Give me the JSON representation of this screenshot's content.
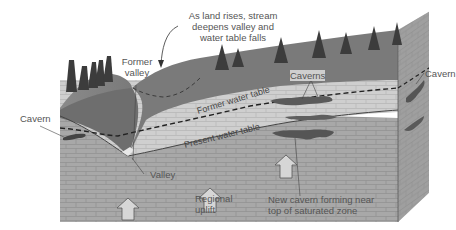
{
  "diagram": {
    "labels": {
      "annotation_top_line1": "As land rises, stream",
      "annotation_top_line2": "deepens valley and",
      "annotation_top_line3": "water table falls",
      "former_valley_line1": "Former",
      "former_valley_line2": "valley",
      "caverns": "Caverns",
      "cavern_right": "Cavern",
      "cavern_left": "Cavern",
      "former_water_table": "Former water table",
      "present_water_table": "Present water table",
      "valley": "Valley",
      "regional_uplift_line1": "Regional",
      "regional_uplift_line2": "uplift",
      "new_cavern_line1": "New cavern forming near",
      "new_cavern_line2": "top of saturated zone"
    },
    "colors": {
      "surface": "#7a7a7a",
      "upper_rock": "#cfcfcf",
      "lower_rock": "#a9a9a9",
      "side_face": "#9a9a9a",
      "valley_cut": "#6e6e6e",
      "cavern": "#5a5a5a",
      "tree": "#3c3c3c",
      "arrow_fill": "#d6d6d6",
      "text": "#555555"
    }
  }
}
